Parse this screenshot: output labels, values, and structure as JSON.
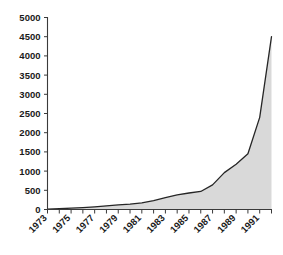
{
  "chart_data": {
    "type": "area",
    "title": "",
    "subtitle": "",
    "xlabel": "",
    "ylabel": "",
    "x": [
      1973,
      1974,
      1975,
      1976,
      1977,
      1978,
      1979,
      1980,
      1981,
      1982,
      1983,
      1984,
      1985,
      1986,
      1987,
      1988,
      1989,
      1990,
      1991,
      1992
    ],
    "values": [
      10,
      20,
      35,
      50,
      70,
      95,
      120,
      140,
      170,
      230,
      310,
      380,
      430,
      470,
      640,
      960,
      1180,
      1450,
      2400,
      4500
    ],
    "series": [
      {
        "name": "series-1",
        "values": [
          10,
          20,
          35,
          50,
          70,
          95,
          120,
          140,
          170,
          230,
          310,
          380,
          430,
          470,
          640,
          960,
          1180,
          1450,
          2400,
          4500
        ]
      }
    ],
    "categories": [
      "1973",
      "1974",
      "1975",
      "1976",
      "1977",
      "1978",
      "1979",
      "1980",
      "1981",
      "1982",
      "1983",
      "1984",
      "1985",
      "1986",
      "1987",
      "1988",
      "1989",
      "1990",
      "1991",
      "1992"
    ],
    "ylim": [
      0,
      5000
    ],
    "xlim": [
      1973,
      1992
    ],
    "ytick_labels": [
      "0",
      "500",
      "1000",
      "1500",
      "2000",
      "2500",
      "3000",
      "3500",
      "4000",
      "4500",
      "5000"
    ],
    "ytick_values": [
      0,
      500,
      1000,
      1500,
      2000,
      2500,
      3000,
      3500,
      4000,
      4500,
      5000
    ],
    "xtick_labels": [
      "1973",
      "1975",
      "1977",
      "1979",
      "1981",
      "1983",
      "1985",
      "1987",
      "1989",
      "1991"
    ],
    "xtick_values": [
      1973,
      1975,
      1977,
      1979,
      1981,
      1983,
      1985,
      1987,
      1989,
      1991
    ],
    "xtick_label_rotation": 45,
    "grid": false,
    "legend": false,
    "legend_position": "none",
    "annotations": [],
    "colors": {
      "area_fill": "#d9d9d9",
      "line": "#262626",
      "axis": "#3a3a3a",
      "text": "#1a1a1a",
      "background": "#ffffff"
    }
  }
}
